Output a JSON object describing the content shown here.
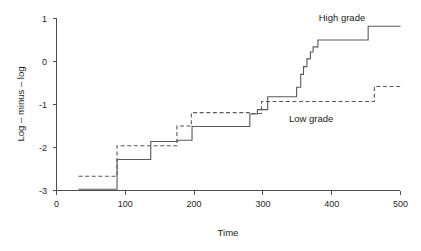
{
  "chart_data": {
    "type": "line",
    "subtype": "step",
    "title": "",
    "xlabel": "Time",
    "ylabel": "Log – minus – log",
    "xlim": [
      0,
      500
    ],
    "ylim": [
      -3,
      1
    ],
    "xticks": [
      0,
      100,
      200,
      300,
      400,
      500
    ],
    "xtick_labels": [
      "0",
      "100",
      "200",
      "300",
      "400",
      "500"
    ],
    "yticks": [
      -3,
      -2,
      -1,
      0,
      1
    ],
    "ytick_labels": [
      "-3",
      "-2",
      "-1",
      "0",
      "1"
    ],
    "grid": false,
    "legend_position": "in-plot-annotations",
    "annotations": [
      {
        "text": "High grade",
        "x": 415,
        "y": 1.02
      },
      {
        "text": "Low grade",
        "x": 370,
        "y": -1.33
      }
    ],
    "series": [
      {
        "name": "High grade",
        "style": "solid",
        "color": "#595959",
        "points": [
          [
            32,
            -2.97
          ],
          [
            88,
            -2.97
          ],
          [
            88,
            -2.28
          ],
          [
            137,
            -2.28
          ],
          [
            137,
            -1.86
          ],
          [
            176,
            -1.86
          ],
          [
            176,
            -1.83
          ],
          [
            197,
            -1.83
          ],
          [
            197,
            -1.51
          ],
          [
            281,
            -1.51
          ],
          [
            281,
            -1.22
          ],
          [
            292,
            -1.22
          ],
          [
            292,
            -1.12
          ],
          [
            307,
            -1.12
          ],
          [
            307,
            -0.82
          ],
          [
            349,
            -0.82
          ],
          [
            349,
            -0.6
          ],
          [
            355,
            -0.6
          ],
          [
            355,
            -0.3
          ],
          [
            359,
            -0.3
          ],
          [
            359,
            -0.12
          ],
          [
            364,
            -0.12
          ],
          [
            364,
            0.06
          ],
          [
            369,
            0.06
          ],
          [
            369,
            0.22
          ],
          [
            373,
            0.22
          ],
          [
            373,
            0.34
          ],
          [
            380,
            0.34
          ],
          [
            380,
            0.5
          ],
          [
            453,
            0.5
          ],
          [
            453,
            0.82
          ],
          [
            500,
            0.82
          ]
        ]
      },
      {
        "name": "Low grade",
        "style": "dashed",
        "color": "#595959",
        "points": [
          [
            32,
            -2.67
          ],
          [
            88,
            -2.67
          ],
          [
            88,
            -1.96
          ],
          [
            175,
            -1.96
          ],
          [
            175,
            -1.5
          ],
          [
            196,
            -1.5
          ],
          [
            196,
            -1.19
          ],
          [
            280,
            -1.19
          ],
          [
            280,
            -1.21
          ],
          [
            298,
            -1.21
          ],
          [
            298,
            -0.93
          ],
          [
            462,
            -0.93
          ],
          [
            462,
            -0.58
          ],
          [
            500,
            -0.58
          ]
        ]
      }
    ]
  }
}
